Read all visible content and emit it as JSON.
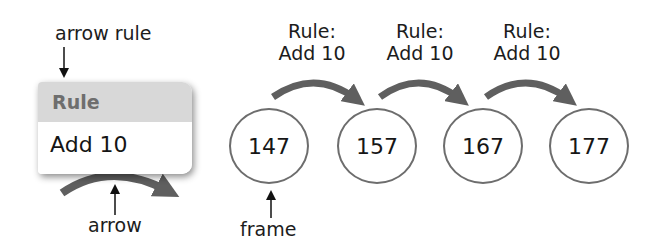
{
  "callouts": {
    "arrow_rule": "arrow rule",
    "arrow": "arrow",
    "frame": "frame"
  },
  "rule_box": {
    "header": "Rule",
    "body": "Add 10"
  },
  "colors": {
    "arrow": "#5f5f5f",
    "frame_border": "#6d6d6d",
    "rule_header_bg": "#d8d8d8",
    "rule_header_text": "#6e6e6e"
  },
  "sequence": {
    "frames": [
      {
        "value": "147"
      },
      {
        "value": "157"
      },
      {
        "value": "167"
      },
      {
        "value": "177"
      }
    ],
    "rules": [
      {
        "line1": "Rule:",
        "line2": "Add 10"
      },
      {
        "line1": "Rule:",
        "line2": "Add 10"
      },
      {
        "line1": "Rule:",
        "line2": "Add 10"
      }
    ]
  }
}
